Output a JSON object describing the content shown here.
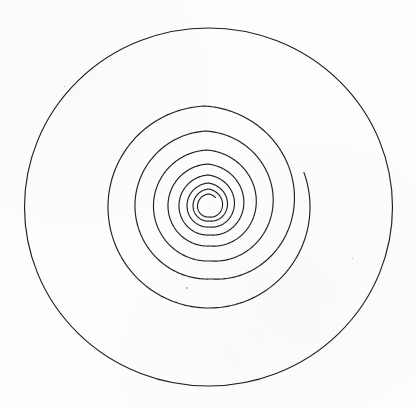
{
  "figure": {
    "kind": "line-drawing",
    "background_color": "#fdfdfc",
    "stroke_color": "#1e1e24",
    "canvas": {
      "width": 417,
      "height": 409
    }
  },
  "chart_data": {
    "type": "line",
    "subtitle": "",
    "xlabel": "",
    "ylabel": "",
    "grid": false,
    "legend": "none",
    "xlim": [
      0,
      417
    ],
    "ylim": [
      0,
      409
    ],
    "annotations": [],
    "series": [
      {
        "name": "bounding-circle",
        "shape": "circle",
        "center": [
          208.5,
          207.0
        ],
        "radius_x": 184.0,
        "radius_y": 179.0,
        "stroke_width": 1.15,
        "closed": true
      },
      {
        "name": "spiral",
        "shape": "logarithmic-spiral",
        "center": [
          209.0,
          207.0
        ],
        "turns": 7.6,
        "start_angle_deg": 20,
        "inner_radius": 1.0,
        "outer_radius": 118.0,
        "growth": "geometric",
        "stroke_width": 1.15,
        "outer_endpoint": [
          278.0,
          107.0
        ],
        "crossings_left_x": [
          108,
          133,
          152,
          166,
          177,
          185,
          191,
          196,
          199,
          202,
          204,
          206,
          207
        ],
        "crossings_right_x": [
          310,
          281,
          263,
          248,
          237,
          229,
          223,
          219,
          216,
          214,
          212,
          211,
          210
        ]
      }
    ]
  },
  "specks": [
    {
      "name": "speck-center-low",
      "x": 186,
      "y": 287,
      "size": 1.6
    },
    {
      "name": "speck-upper-left",
      "x": 64,
      "y": 86,
      "size": 1.2
    },
    {
      "name": "speck-right",
      "x": 352,
      "y": 258,
      "size": 1.1
    }
  ]
}
